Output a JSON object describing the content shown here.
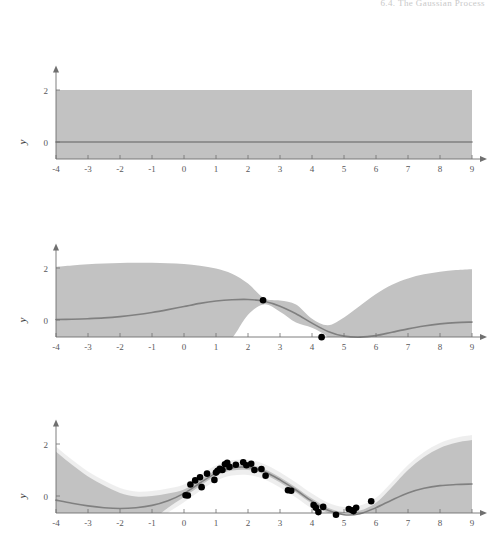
{
  "page": {
    "running_head": "6.4. The Gaussian Process",
    "background": "#ffffff"
  },
  "style": {
    "band_color": "#c2c2c2",
    "band_inner_color": "#e8e8e8",
    "mean_line_color": "#808080",
    "axis_color": "#6f6f6f",
    "point_color": "#000000",
    "tick_label_color": "#58585a"
  },
  "axes": {
    "x_label": "x",
    "y_label": "y",
    "x_ticks": [
      "-4",
      "-3",
      "-2",
      "-1",
      "0",
      "1",
      "2",
      "3",
      "4",
      "5",
      "6",
      "7",
      "8",
      "9"
    ],
    "x_tick_values": [
      -4,
      -3,
      -2,
      -1,
      0,
      1,
      2,
      3,
      4,
      5,
      6,
      7,
      8,
      9
    ],
    "y_ticks": [
      "2",
      "0",
      "-2"
    ],
    "y_tick_values": [
      2,
      0,
      -2
    ],
    "xlim": [
      -4,
      9
    ],
    "ylim": [
      -2.6,
      2.6
    ]
  },
  "chart_data": {
    "type": "line",
    "title": "",
    "xlabel": "x",
    "ylabel": "y",
    "xlim": [
      -4,
      9
    ],
    "ylim": [
      -2.6,
      2.6
    ],
    "grid": false,
    "legend": "none",
    "panel_count": 3,
    "panels": [
      {
        "index": 0,
        "name": "prior-no-data",
        "n_points": 0,
        "mean_constant": 0,
        "band_halfwidth_constant": 2,
        "x": [
          -4,
          -3,
          -2,
          -1,
          0,
          1,
          2,
          3,
          4,
          5,
          6,
          7,
          8,
          9
        ],
        "mean": [
          0,
          0,
          0,
          0,
          0,
          0,
          0,
          0,
          0,
          0,
          0,
          0,
          0,
          0
        ],
        "upper": [
          2,
          2,
          2,
          2,
          2,
          2,
          2,
          2,
          2,
          2,
          2,
          2,
          2,
          2
        ],
        "lower": [
          -2,
          -2,
          -2,
          -2,
          -2,
          -2,
          -2,
          -2,
          -2,
          -2,
          -2,
          -2,
          -2,
          -2
        ],
        "points": []
      },
      {
        "index": 1,
        "name": "posterior-two-points",
        "n_points": 2,
        "x": [
          -4,
          -3.5,
          -3,
          -2.5,
          -2,
          -1.5,
          -1,
          -0.5,
          0,
          0.5,
          1,
          1.5,
          2,
          2.5,
          3,
          3.5,
          4,
          4.5,
          5,
          5.5,
          6,
          6.5,
          7,
          7.5,
          8,
          8.5,
          9
        ],
        "mean": [
          0.02,
          0.03,
          0.05,
          0.08,
          0.13,
          0.2,
          0.29,
          0.4,
          0.52,
          0.64,
          0.73,
          0.78,
          0.79,
          0.72,
          0.53,
          0.24,
          -0.12,
          -0.44,
          -0.62,
          -0.66,
          -0.6,
          -0.47,
          -0.34,
          -0.23,
          -0.15,
          -0.1,
          -0.08
        ],
        "upper": [
          2.05,
          2.1,
          2.14,
          2.17,
          2.19,
          2.2,
          2.2,
          2.18,
          2.15,
          2.09,
          1.98,
          1.78,
          1.4,
          0.84,
          0.75,
          0.6,
          0.05,
          -0.2,
          0.1,
          0.55,
          1.0,
          1.36,
          1.6,
          1.76,
          1.86,
          1.92,
          1.95
        ],
        "lower": [
          -2.02,
          -2.05,
          -2.07,
          -2.08,
          -2.08,
          -2.05,
          -2.0,
          -1.9,
          -1.74,
          -1.5,
          -1.16,
          -0.7,
          0.2,
          0.6,
          0.32,
          -0.1,
          -0.3,
          -0.66,
          -1.34,
          -1.85,
          -2.2,
          -2.3,
          -2.28,
          -2.22,
          -2.16,
          -2.12,
          -2.1
        ],
        "points": [
          {
            "x": 2.47,
            "y": 0.76
          },
          {
            "x": 4.3,
            "y": -0.66
          }
        ]
      },
      {
        "index": 2,
        "name": "posterior-many-points",
        "n_points": 34,
        "x": [
          -4,
          -3.5,
          -3,
          -2.5,
          -2,
          -1.5,
          -1,
          -0.5,
          0,
          0.5,
          1,
          1.5,
          2,
          2.5,
          3,
          3.5,
          4,
          4.5,
          5,
          5.5,
          6,
          6.5,
          7,
          7.5,
          8,
          8.5,
          9
        ],
        "mean": [
          -0.16,
          -0.28,
          -0.38,
          -0.45,
          -0.48,
          -0.45,
          -0.36,
          -0.18,
          0.1,
          0.5,
          0.88,
          1.08,
          1.1,
          0.94,
          0.62,
          0.23,
          -0.2,
          -0.55,
          -0.72,
          -0.68,
          -0.45,
          -0.15,
          0.12,
          0.3,
          0.4,
          0.44,
          0.46
        ],
        "upper": [
          1.7,
          1.2,
          0.75,
          0.4,
          0.12,
          -0.02,
          0.0,
          0.1,
          0.25,
          0.62,
          0.98,
          1.18,
          1.2,
          1.04,
          0.72,
          0.33,
          -0.1,
          -0.45,
          -0.62,
          -0.56,
          -0.26,
          0.35,
          1.0,
          1.5,
          1.85,
          2.05,
          2.15
        ],
        "lower": [
          -2.2,
          -2.3,
          -2.28,
          -2.15,
          -1.9,
          -1.5,
          -0.95,
          -0.45,
          -0.05,
          0.38,
          0.78,
          0.98,
          1.0,
          0.84,
          0.52,
          0.13,
          -0.3,
          -0.65,
          -0.82,
          -0.8,
          -0.66,
          -0.68,
          -0.78,
          -0.9,
          -1.02,
          -1.1,
          -1.18
        ],
        "points": [
          {
            "x": 0.05,
            "y": 0.03
          },
          {
            "x": 0.12,
            "y": 0.02
          },
          {
            "x": 0.2,
            "y": 0.44
          },
          {
            "x": 0.35,
            "y": 0.6
          },
          {
            "x": 0.5,
            "y": 0.72
          },
          {
            "x": 0.55,
            "y": 0.34
          },
          {
            "x": 0.72,
            "y": 0.86
          },
          {
            "x": 0.95,
            "y": 0.62
          },
          {
            "x": 1.0,
            "y": 0.9
          },
          {
            "x": 1.05,
            "y": 0.97
          },
          {
            "x": 1.12,
            "y": 1.05
          },
          {
            "x": 1.2,
            "y": 1.0
          },
          {
            "x": 1.28,
            "y": 1.22
          },
          {
            "x": 1.35,
            "y": 1.28
          },
          {
            "x": 1.42,
            "y": 1.12
          },
          {
            "x": 1.62,
            "y": 1.2
          },
          {
            "x": 1.85,
            "y": 1.3
          },
          {
            "x": 1.95,
            "y": 1.18
          },
          {
            "x": 2.1,
            "y": 1.24
          },
          {
            "x": 2.2,
            "y": 1.0
          },
          {
            "x": 2.42,
            "y": 1.04
          },
          {
            "x": 2.55,
            "y": 0.78
          },
          {
            "x": 3.25,
            "y": 0.22
          },
          {
            "x": 3.35,
            "y": 0.2
          },
          {
            "x": 4.05,
            "y": -0.35
          },
          {
            "x": 4.12,
            "y": -0.45
          },
          {
            "x": 4.2,
            "y": -0.62
          },
          {
            "x": 4.35,
            "y": -0.42
          },
          {
            "x": 4.75,
            "y": -0.72
          },
          {
            "x": 5.15,
            "y": -0.5
          },
          {
            "x": 5.25,
            "y": -0.55
          },
          {
            "x": 5.3,
            "y": -0.58
          },
          {
            "x": 5.38,
            "y": -0.45
          },
          {
            "x": 5.85,
            "y": -0.2
          }
        ]
      }
    ]
  }
}
